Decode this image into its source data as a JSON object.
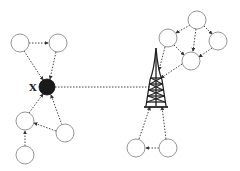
{
  "diagram": {
    "type": "network-topology",
    "hub_label": "X",
    "colors": {
      "node_stroke": "#8a8a8a",
      "node_fill": "#ffffff",
      "hub_fill": "#1a1a1a",
      "link": "#444444",
      "tower": "#222222"
    },
    "nodes": [
      {
        "id": "n1",
        "x": 20,
        "y": 43,
        "r": 9
      },
      {
        "id": "n2",
        "x": 58,
        "y": 43,
        "r": 9
      },
      {
        "id": "n3",
        "x": 25,
        "y": 121,
        "r": 9
      },
      {
        "id": "n4",
        "x": 65,
        "y": 133,
        "r": 9
      },
      {
        "id": "n5",
        "x": 25,
        "y": 155,
        "r": 9
      },
      {
        "id": "n6",
        "x": 197,
        "y": 20,
        "r": 9
      },
      {
        "id": "n7",
        "x": 168,
        "y": 38,
        "r": 9
      },
      {
        "id": "n8",
        "x": 218,
        "y": 41,
        "r": 9
      },
      {
        "id": "n9",
        "x": 191,
        "y": 61,
        "r": 9
      },
      {
        "id": "n10",
        "x": 136,
        "y": 148,
        "r": 9
      },
      {
        "id": "n11",
        "x": 168,
        "y": 148,
        "r": 9
      }
    ],
    "hub": {
      "id": "X",
      "x": 47,
      "y": 87,
      "r": 8
    },
    "tower": {
      "x": 156,
      "apex_y": 50,
      "base_y": 108
    }
  }
}
